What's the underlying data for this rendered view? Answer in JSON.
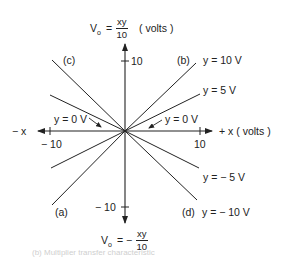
{
  "diagram": {
    "type": "multiplier transfer characteristic",
    "top_label": {
      "prefix": "V",
      "subscript": "o",
      "equals": "=",
      "numerator": "xy",
      "denominator": "10",
      "units": "( volts )"
    },
    "bottom_label": {
      "prefix": "V",
      "subscript": "o",
      "equals": "= −",
      "numerator": "xy",
      "denominator": "10"
    },
    "axes": {
      "x_pos_label": "+ x ( volts )",
      "x_neg_label": "− x",
      "x_tick_pos": "10",
      "x_tick_neg": "− 10",
      "y_tick_pos": "10",
      "y_tick_neg": "− 10"
    },
    "quadrants": {
      "a": "(a)",
      "b": "(b)",
      "c": "(c)",
      "d": "(d)"
    },
    "curve_labels": {
      "y10": "y = 10 V",
      "y5": "y = 5 V",
      "y0_left": "y = 0 V",
      "y0_right": "y = 0 V",
      "yneg5": "y = − 5 V",
      "yneg10": "y = − 10 V"
    },
    "footer_text": "(b) Multiplier transfer characteristic",
    "colors": {
      "line": "#222222",
      "background": "#ffffff"
    }
  }
}
